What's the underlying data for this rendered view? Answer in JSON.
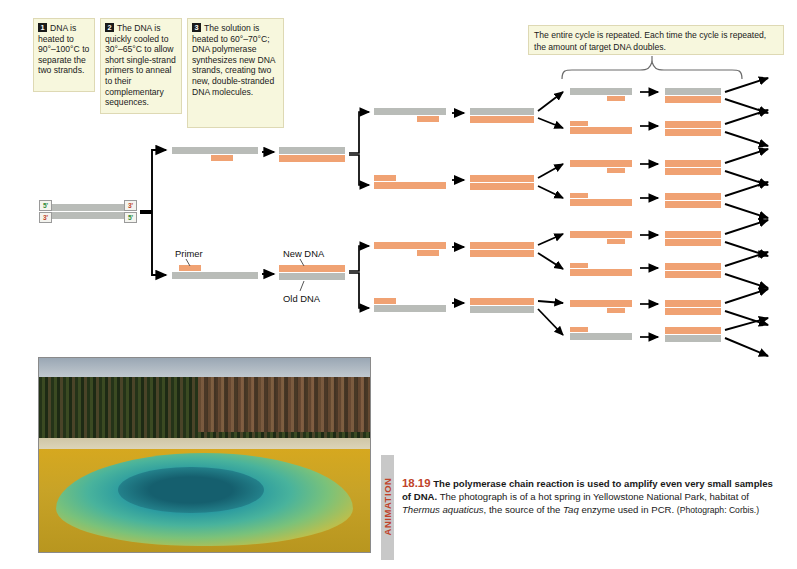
{
  "figure": {
    "number": "18.19",
    "title_bold": "The polymerase chain reaction is used to amplify even very small samples of DNA.",
    "body_1": " The photograph is of a hot spring in Yellowstone National Park, habitat of ",
    "italic_1": "Thermus aquaticus",
    "body_2": ", the source of the ",
    "italic_2": "Taq",
    "body_3": " enzyme used in PCR. ",
    "credit": "(Photograph: Corbis.)",
    "animation_tab": "ANIMATION",
    "accent_color": "#c0432a"
  },
  "steps": [
    {
      "num": "1",
      "text": "DNA is heated to 90°–100°C to separate the two strands."
    },
    {
      "num": "2",
      "text": "The DNA is quickly cooled to 30°–65°C to allow short single-strand primers to anneal to their complementary sequences."
    },
    {
      "num": "3",
      "text": "The solution is heated to 60°–70°C; DNA polymerase synthesizes new DNA strands, creating two new, double-stranded DNA molecules."
    }
  ],
  "cycle_note": "The entire cycle is repeated. Each time the cycle is repeated, the amount of target DNA doubles.",
  "labels": {
    "primer": "Primer",
    "new_dna": "New DNA",
    "old_dna": "Old DNA"
  },
  "end_tags": {
    "top_left": "5'",
    "bottom_left": "3'",
    "top_right": "3'",
    "bottom_right": "5'"
  },
  "colors": {
    "old_dna_gray": "#b9bcb8",
    "new_dna_orange": "#f0a273",
    "note_background": "#f7f7dd",
    "note_border": "#ded9b4",
    "end_tag_green": "#2e8b3a",
    "end_tag_red": "#c0432a"
  },
  "photo": {
    "alt": "hot spring in Yellowstone National Park"
  }
}
